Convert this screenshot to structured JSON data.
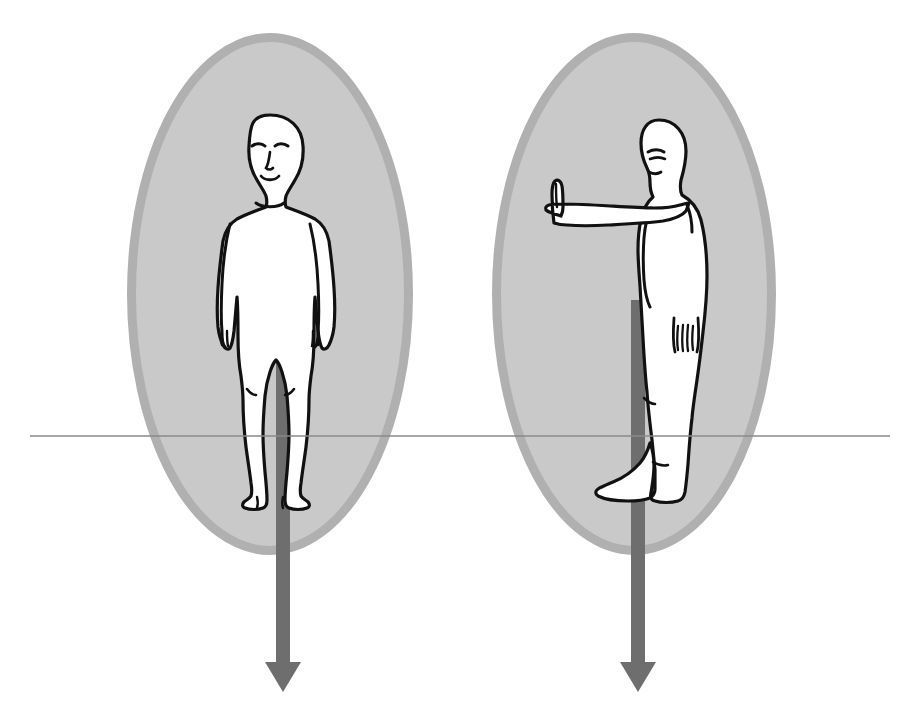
{
  "canvas": {
    "width": 919,
    "height": 727,
    "background_color": "#ffffff"
  },
  "palette": {
    "ellipse_fill": "#c9c9c9",
    "ellipse_border": "#b0b0b0",
    "arrow_color": "#6e6e6e",
    "horizon_line_color": "#8a8a8a",
    "figure_fill": "#ffffff",
    "figure_outline": "#111111",
    "navel_shadow": "#bdbdbd"
  },
  "horizon_line": {
    "label": "horizontal reference line",
    "x_start": 30,
    "x_end": 890,
    "y": 436,
    "thickness": 1.4
  },
  "panels": [
    {
      "id": "front-view",
      "label": "Anterior (front) view of standing human figure",
      "ellipse": {
        "cx": 270,
        "cy": 294,
        "rx": 143,
        "ry": 261,
        "border_width": 9
      },
      "arrow": {
        "label": "downward gravity vector",
        "x": 283,
        "y_start": 300,
        "y_tip": 692,
        "shaft_width": 14,
        "head_width": 36,
        "head_height": 30,
        "direction": "down"
      },
      "figure": {
        "pose": "standing, arms at sides, facing viewer",
        "has_face": true,
        "face_features": [
          "left eyebrow",
          "right eyebrow",
          "nose",
          "mouth"
        ],
        "head_cx": 270,
        "head_cy": 145,
        "top_y": 115,
        "bottom_y": 500
      }
    },
    {
      "id": "side-view",
      "label": "Lateral (side) view of standing human figure with arm extended forward",
      "ellipse": {
        "cx": 634,
        "cy": 294,
        "rx": 142,
        "ry": 261,
        "border_width": 9
      },
      "arrow": {
        "label": "downward gravity vector",
        "x": 638,
        "y_start": 300,
        "y_tip": 692,
        "shaft_width": 14,
        "head_width": 36,
        "head_height": 30,
        "direction": "down"
      },
      "figure": {
        "pose": "standing in profile facing left, near arm extended horizontally forward, hand upright",
        "has_face": true,
        "face_features": [
          "eyebrow",
          "eye",
          "nose profile",
          "mouth",
          "chin"
        ],
        "head_cx": 660,
        "head_cy": 150,
        "top_y": 120,
        "bottom_y": 500
      }
    }
  ],
  "diagram_meta": {
    "subject": "human body orientation diagram",
    "view_count": 2,
    "annotations": []
  }
}
